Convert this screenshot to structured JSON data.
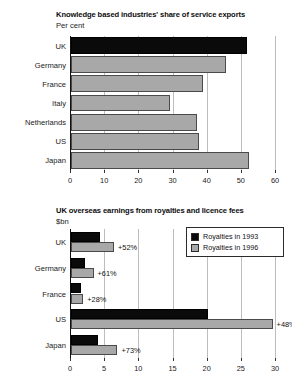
{
  "chart_data": [
    {
      "id": "knowledge-share",
      "type": "bar",
      "orientation": "horizontal",
      "title": "Knowledge based industries' share of service exports",
      "subtitle": "Per cent",
      "xlabel": "",
      "ylabel": "",
      "xlim": [
        0,
        60
      ],
      "xticks": [
        0,
        10,
        20,
        30,
        40,
        50,
        60
      ],
      "xtick_labels": [
        "0",
        "10",
        "20",
        "30",
        "40",
        "50",
        "60"
      ],
      "grid": true,
      "legend": null,
      "categories": [
        "UK",
        "Germany",
        "France",
        "Italy",
        "Netherlands",
        "US",
        "Japan"
      ],
      "values": [
        51.5,
        45.5,
        38.5,
        29,
        37,
        37.5,
        52
      ],
      "bar_styles": [
        "dark",
        "light",
        "light",
        "light",
        "light",
        "light",
        "light"
      ]
    },
    {
      "id": "royalties-earnings",
      "type": "bar",
      "orientation": "horizontal",
      "title": "UK overseas earnings from royalties and licence fees",
      "subtitle": "$bn",
      "xlabel": "",
      "ylabel": "",
      "xlim": [
        0,
        30
      ],
      "xticks": [
        0,
        5,
        10,
        15,
        20,
        25,
        30
      ],
      "xtick_labels": [
        "0",
        "5",
        "10",
        "15",
        "20",
        "25",
        "30"
      ],
      "grid": true,
      "legend_position": "top-right",
      "categories": [
        "UK",
        "Germany",
        "France",
        "US",
        "Japan"
      ],
      "series": [
        {
          "name": "Royalties in 1993",
          "style": "dark",
          "values": [
            4.2,
            2.1,
            1.4,
            20.0,
            3.9
          ]
        },
        {
          "name": "Royalties in 1996",
          "style": "light",
          "values": [
            6.3,
            3.3,
            1.8,
            29.5,
            6.8
          ]
        }
      ],
      "annotations": [
        "+52%",
        "+61%",
        "+28%",
        "+48%",
        "+73%"
      ]
    }
  ],
  "colors": {
    "dark_series": "#0a0a0a",
    "light_series": "#a8a8a8",
    "gridline": "#bdbdbd",
    "axis": "#111111",
    "background": "#ffffff"
  }
}
